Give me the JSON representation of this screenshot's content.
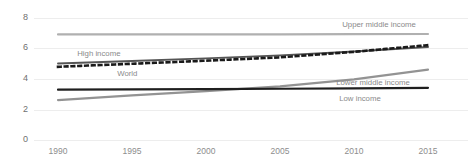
{
  "chart_data": {
    "type": "line",
    "title": "",
    "subtitle": "",
    "xlabel": "",
    "ylabel": "",
    "xlim": [
      1990,
      2015
    ],
    "ylim": [
      0,
      8
    ],
    "grid": true,
    "legend_position": "inline-labels",
    "x": [
      1990,
      1995,
      2000,
      2005,
      2010,
      2015
    ],
    "xtick_labels": [
      "1990",
      "1995",
      "2000",
      "2005",
      "2010",
      "2015"
    ],
    "ytick_labels": [
      "0",
      "2",
      "4",
      "6",
      "8"
    ],
    "ytick_values": [
      0,
      2,
      4,
      6,
      8
    ],
    "series": [
      {
        "name": "Upper middle income",
        "label": "Upper middle income",
        "color": "#b0b0b0",
        "style": "solid",
        "width": 2.2,
        "values": [
          6.92,
          6.92,
          6.92,
          6.93,
          6.94,
          6.95
        ],
        "label_x": 2009.2,
        "label_y": 7.55
      },
      {
        "name": "High income",
        "label": "High income",
        "color": "#555555",
        "style": "solid",
        "width": 1.9,
        "values": [
          5.02,
          5.18,
          5.35,
          5.55,
          5.8,
          6.1
        ],
        "label_x": 1991.3,
        "label_y": 5.62
      },
      {
        "name": "World",
        "label": "World",
        "color": "#1a1a1a",
        "style": "dotted",
        "width": 2.6,
        "values": [
          4.8,
          5.0,
          5.2,
          5.42,
          5.78,
          6.22
        ],
        "label_x": 1994.0,
        "label_y": 4.36
      },
      {
        "name": "Lower middle income",
        "label": "Lower middle income",
        "color": "#939393",
        "style": "solid",
        "width": 2.2,
        "values": [
          2.62,
          2.92,
          3.2,
          3.52,
          3.98,
          4.62
        ],
        "label_x": 2008.8,
        "label_y": 3.72
      },
      {
        "name": "Low income",
        "label": "Low income",
        "color": "#1f1f1f",
        "style": "solid",
        "width": 2.2,
        "values": [
          3.3,
          3.32,
          3.34,
          3.36,
          3.38,
          3.42
        ],
        "label_x": 2009.0,
        "label_y": 2.72
      }
    ],
    "colors": {
      "grid": "#ededed",
      "ytick_text": "#6f6f6f",
      "xtick_text": "#8d8d8d",
      "label_text": "#8a8a8a",
      "background": "#ffffff"
    }
  }
}
